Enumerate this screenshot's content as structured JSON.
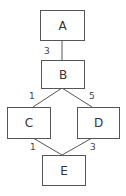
{
  "diagram": {
    "type": "weighted-graph",
    "colors": {
      "stroke": "#555555",
      "text": "#333333",
      "background": "#ffffff"
    },
    "nodes": [
      {
        "id": "A",
        "label": "A"
      },
      {
        "id": "B",
        "label": "B"
      },
      {
        "id": "C",
        "label": "C"
      },
      {
        "id": "D",
        "label": "D"
      },
      {
        "id": "E",
        "label": "E"
      }
    ],
    "edges": [
      {
        "from": "A",
        "to": "B",
        "weight": "3"
      },
      {
        "from": "B",
        "to": "C",
        "weight": "1"
      },
      {
        "from": "B",
        "to": "D",
        "weight": "5"
      },
      {
        "from": "C",
        "to": "E",
        "weight": "1"
      },
      {
        "from": "D",
        "to": "E",
        "weight": "3"
      }
    ]
  }
}
